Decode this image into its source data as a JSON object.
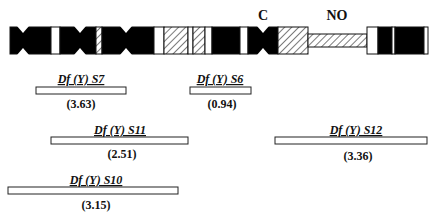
{
  "figure": {
    "type": "chromosome-deficiency-map",
    "chromosome": "Y",
    "markers": [
      {
        "id": "centromere",
        "label": "C",
        "x": 263
      },
      {
        "id": "nucleolus-organizer",
        "label": "NO",
        "x": 337
      }
    ],
    "bands": [
      {
        "x0": 10,
        "x1": 51,
        "fill": "black"
      },
      {
        "x0": 51,
        "x1": 60,
        "fill": "white"
      },
      {
        "x0": 60,
        "x1": 96,
        "fill": "black"
      },
      {
        "x0": 96,
        "x1": 102,
        "fill": "hatched"
      },
      {
        "x0": 102,
        "x1": 154,
        "fill": "black"
      },
      {
        "x0": 154,
        "x1": 164,
        "fill": "white"
      },
      {
        "x0": 164,
        "x1": 188,
        "fill": "hatched"
      },
      {
        "x0": 188,
        "x1": 193,
        "fill": "white"
      },
      {
        "x0": 193,
        "x1": 205,
        "fill": "hatched"
      },
      {
        "x0": 205,
        "x1": 212,
        "fill": "white"
      },
      {
        "x0": 212,
        "x1": 240,
        "fill": "black"
      },
      {
        "x0": 240,
        "x1": 248,
        "fill": "white"
      },
      {
        "x0": 248,
        "x1": 278,
        "fill": "black"
      },
      {
        "x0": 278,
        "x1": 308,
        "fill": "hatched"
      },
      {
        "x0": 308,
        "x1": 367,
        "fill": "hatched-stalk"
      },
      {
        "x0": 367,
        "x1": 378,
        "fill": "white"
      },
      {
        "x0": 378,
        "x1": 392,
        "fill": "black"
      },
      {
        "x0": 392,
        "x1": 395,
        "fill": "white"
      },
      {
        "x0": 395,
        "x1": 424,
        "fill": "black"
      },
      {
        "x0": 424,
        "x1": 428,
        "fill": "white"
      }
    ],
    "constrictions": [
      23,
      80,
      126,
      263
    ],
    "deficiencies": [
      {
        "name": "Df (Y) S7",
        "value": "(3.63)",
        "x0": 36,
        "x1": 126,
        "row": 0
      },
      {
        "name": "Df (Y) S6",
        "value": "(0.94)",
        "x0": 190,
        "x1": 251,
        "row": 0
      },
      {
        "name": "Df (Y) S11",
        "value": "(2.51)",
        "x0": 51,
        "x1": 188,
        "row": 1
      },
      {
        "name": "Df (Y) S12",
        "value": "(3.36)",
        "x0": 275,
        "x1": 427,
        "row": 1
      },
      {
        "name": "Df (Y) S10",
        "value": "(3.15)",
        "x0": 8,
        "x1": 178,
        "row": 2
      }
    ]
  },
  "labels": {
    "centromere": "C",
    "nucleolus_organizer": "NO",
    "s7_name": "Df (Y) S7",
    "s7_value": "(3.63)",
    "s6_name": "Df (Y) S6",
    "s6_value": "(0.94)",
    "s11_name": "Df (Y) S11",
    "s11_value": "(2.51)",
    "s12_name": "Df (Y) S12",
    "s12_value": "(3.36)",
    "s10_name": "Df (Y) S10",
    "s10_value": "(3.15)"
  },
  "colors": {
    "ink": "#111111",
    "paper": "#ffffff"
  }
}
